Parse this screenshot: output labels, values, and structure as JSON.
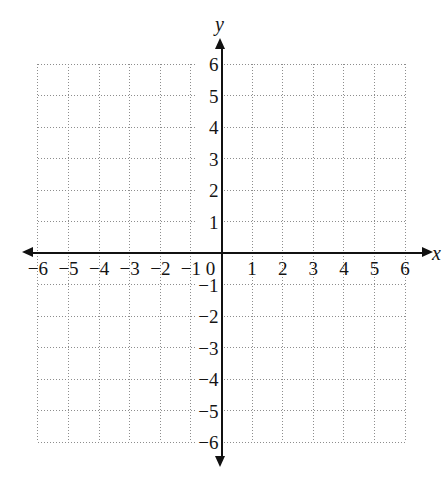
{
  "figure": {
    "type": "coordinate-plane",
    "title": "",
    "background_color": "#ffffff",
    "axis_color": "#111111",
    "grid_color": "#8d8d8d",
    "label_color": "#141414"
  },
  "axes": {
    "x_axis_label": "x",
    "y_axis_label": "y",
    "x_origin_label": "0",
    "x_tick_labels": [
      "−6",
      "−5",
      "−4",
      "−3",
      "−2",
      "−1",
      "1",
      "2",
      "3",
      "4",
      "5",
      "6"
    ],
    "y_tick_labels": [
      "6",
      "5",
      "4",
      "3",
      "2",
      "1",
      "−1",
      "−2",
      "−3",
      "−4",
      "−5",
      "−6"
    ]
  },
  "chart_data": {
    "type": "scatter",
    "title": "",
    "subtitle": "",
    "xlabel": "x",
    "ylabel": "y",
    "xlim": [
      -6,
      6
    ],
    "ylim": [
      -6,
      6
    ],
    "xticks": [
      -6,
      -5,
      -4,
      -3,
      -2,
      -1,
      0,
      1,
      2,
      3,
      4,
      5,
      6
    ],
    "yticks": [
      -6,
      -5,
      -4,
      -3,
      -2,
      -1,
      0,
      1,
      2,
      3,
      4,
      5,
      6
    ],
    "xtick_labels": [
      "−6",
      "−5",
      "−4",
      "−3",
      "−2",
      "−1",
      "0",
      "1",
      "2",
      "3",
      "4",
      "5",
      "6"
    ],
    "ytick_labels": [
      "−6",
      "−5",
      "−4",
      "−3",
      "−2",
      "−1",
      "0",
      "1",
      "2",
      "3",
      "4",
      "5",
      "6"
    ],
    "grid": true,
    "grid_style": "dotted",
    "legend": false,
    "legend_position": "none",
    "series": [],
    "x": [],
    "values": [],
    "annotations": []
  }
}
